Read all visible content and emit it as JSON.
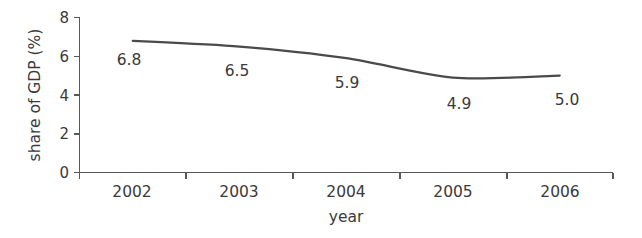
{
  "chart_data": {
    "type": "line",
    "title": "",
    "subtitle": "",
    "xlabel": "year",
    "ylabel": "share of GDP (%)",
    "categories": [
      "2002",
      "2003",
      "2004",
      "2005",
      "2006"
    ],
    "values": [
      6.8,
      6.5,
      5.9,
      4.9,
      5.0
    ],
    "point_labels": [
      "6.8",
      "6.5",
      "5.9",
      "4.9",
      "5.0"
    ],
    "series": [
      {
        "name": "share of GDP (%)",
        "values": [
          6.8,
          6.5,
          5.9,
          4.9,
          5.0
        ]
      }
    ],
    "ylim": [
      0,
      8
    ],
    "y_ticks": [
      0,
      2,
      4,
      6,
      8
    ],
    "y_tick_labels": [
      "0",
      "2",
      "4",
      "6",
      "8"
    ],
    "x_tick_labels": [
      "2002",
      "2003",
      "2004",
      "2005",
      "2006"
    ],
    "grid": false,
    "legend": false,
    "legend_position": "none",
    "line_color": "#4a4a4a",
    "axis_color": "#595959",
    "text_color": "#3a3a3a",
    "background_color": "#ffffff"
  }
}
